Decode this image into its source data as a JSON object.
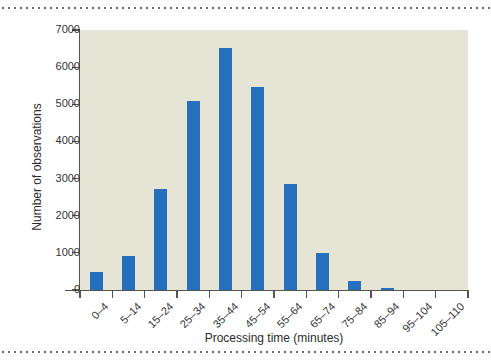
{
  "figure": {
    "background_color": "#ffffff",
    "plot_background_color": "#e6e4d5",
    "bar_color": "#2470bd",
    "axis_color": "#55554f",
    "rule_top_label": "dotted-rule",
    "rule_bottom_label": "dotted-rule"
  },
  "chart_data": {
    "type": "bar",
    "title": "",
    "subtitle": "",
    "xlabel": "Processing time (minutes)",
    "ylabel": "Number of observations",
    "categories": [
      "0–4",
      "5–14",
      "15–24",
      "25–34",
      "35–44",
      "45–54",
      "55–64",
      "65–74",
      "75–84",
      "85–94",
      "95–104",
      "105–110"
    ],
    "values": [
      480,
      920,
      2720,
      5080,
      6520,
      5460,
      2860,
      1000,
      230,
      55,
      0,
      0
    ],
    "ylim": [
      0,
      7000
    ],
    "yticks": [
      0,
      1000,
      2000,
      3000,
      4000,
      5000,
      6000,
      7000
    ],
    "ytick_labels": [
      "0",
      "1000",
      "2000",
      "3000",
      "4000",
      "5000",
      "6000",
      "7000"
    ],
    "grid": false,
    "legend": null,
    "legend_position": "none",
    "annotations": []
  }
}
